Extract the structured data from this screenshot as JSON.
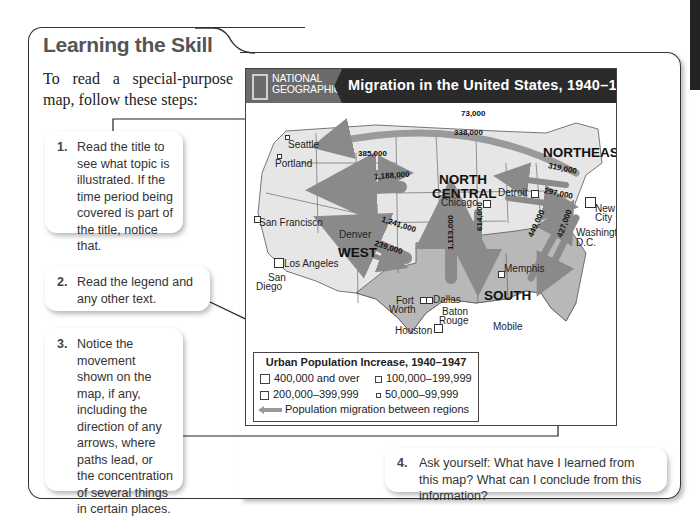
{
  "section": {
    "title": "Learning the Skill",
    "intro": "To read a special-purpose map, follow these steps:"
  },
  "steps": [
    {
      "number": "1.",
      "text": "Read the title to see what topic is illustrated. If the time period being covered is part of the title, notice that."
    },
    {
      "number": "2.",
      "text": "Read the legend and any other text."
    },
    {
      "number": "3.",
      "text": "Notice the movement shown on the map, if any, including the direction of any arrows, where paths lead, or the concentration of several things in certain places."
    },
    {
      "number": "4.",
      "text": "Ask yourself: What have I learned from this map? What can I conclude from this information?"
    }
  ],
  "map": {
    "publisher_line1": "NATIONAL",
    "publisher_line2": "GEOGRAPHIC",
    "title": "Migration in the United States, 1940–1950",
    "regions": {
      "west": "WEST",
      "north_central_1": "NORTH",
      "north_central_2": "CENTRAL",
      "northeast": "NORTHEAST",
      "south": "SOUTH"
    },
    "cities": {
      "seattle": "Seattle",
      "portland": "Portland",
      "san_francisco": "San Francisco",
      "los_angeles": "Los Angeles",
      "san_diego_1": "San",
      "san_diego_2": "Diego",
      "denver": "Denver",
      "chicago": "Chicago",
      "detroit": "Detroit",
      "new_york_1": "New York",
      "new_york_2": "City",
      "washington_1": "Washington,",
      "washington_2": "D.C.",
      "memphis": "Memphis",
      "fort_worth_1": "Fort",
      "fort_worth_2": "Worth",
      "dallas": "Dallas",
      "baton_rouge_1": "Baton",
      "baton_rouge_2": "Rouge",
      "houston": "Houston",
      "mobile": "Mobile"
    },
    "flows": {
      "ne_to_west_top": "73,000",
      "ne_to_west": "338,000",
      "west_to_nc": "385,000",
      "nc_to_west": "1,188,000",
      "south_to_west": "1,241,000",
      "west_to_south": "239,000",
      "south_to_nc": "1,113,000",
      "nc_to_south": "614,000",
      "ne_to_nc": "319,000",
      "nc_to_ne": "297,000",
      "south_to_ne_1": "449,000",
      "ne_to_south": "427,000"
    },
    "legend": {
      "title": "Urban Population Increase, 1940–1947",
      "items": [
        "400,000 and over",
        "100,000–199,999",
        "200,000–399,999",
        "50,000–99,999"
      ],
      "arrow_label": "Population migration between regions"
    }
  },
  "colors": {
    "header_dark": "#2a2a2a",
    "logo_gray": "#6b6b6b",
    "land_light": "#e6e6e6",
    "land_south": "#b8b8b8",
    "arrow_gray": "#8a8a8a"
  }
}
